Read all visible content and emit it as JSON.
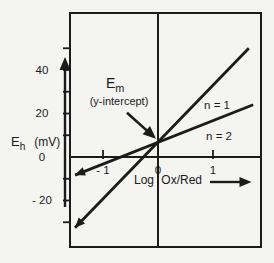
{
  "canvas": {
    "background": "#f4f4f1",
    "ink": "#1b1b1b",
    "width": 274,
    "height": 263
  },
  "chart_data": {
    "type": "line",
    "title": "",
    "xlabel": "Log Ox/Red",
    "ylabel_symbol": "E",
    "ylabel_sub": "h",
    "ylabel_unit": "(mV)",
    "grid": false,
    "xlim": [
      -1.6,
      1.9
    ],
    "ylim": [
      -41,
      66
    ],
    "x_ticks": [
      {
        "value": -1,
        "label": "- 1"
      },
      {
        "value": 0,
        "label": "0"
      },
      {
        "value": 1,
        "label": "1"
      }
    ],
    "y_tick_labels": [
      {
        "value": 40,
        "label": "40"
      },
      {
        "value": 20,
        "label": "20"
      },
      {
        "value": 0,
        "label": "0"
      },
      {
        "value": -20,
        "label": "- 20"
      }
    ],
    "y_minor_tick_values": [
      50,
      40,
      30,
      20,
      10,
      -10,
      -20,
      -30
    ],
    "series": [
      {
        "name": "n = 1",
        "points": [
          [
            -1.51,
            -32.5
          ],
          [
            1.65,
            50.0
          ]
        ]
      },
      {
        "name": "n = 2",
        "points": [
          [
            -1.51,
            -8.3
          ],
          [
            1.73,
            24.0
          ]
        ]
      }
    ],
    "annotation": {
      "symbol": "E",
      "subscript": "m",
      "caption": "(y-intercept)",
      "target": {
        "x": 0,
        "y": 7
      }
    },
    "y_intercept_mV": 7
  }
}
